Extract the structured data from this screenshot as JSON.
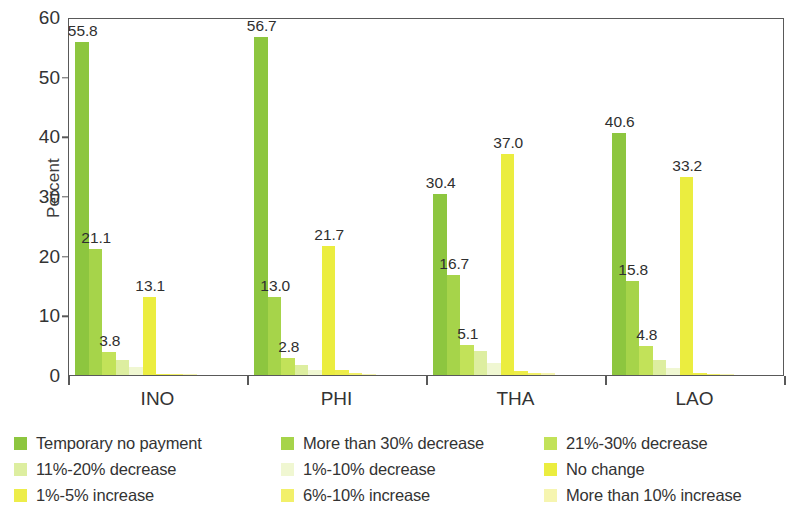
{
  "chart_data": {
    "type": "bar",
    "title": "",
    "subtitle": "",
    "xlabel": "",
    "ylabel": "Percent",
    "ylim": [
      0,
      60
    ],
    "yticks": [
      0,
      10,
      20,
      30,
      40,
      50,
      60
    ],
    "ytick_labels": [
      "0",
      "10",
      "20",
      "30",
      "40",
      "50",
      "60"
    ],
    "grid": false,
    "legend_position": "bottom",
    "grouping": "grouped",
    "categories": [
      "INO",
      "PHI",
      "THA",
      "LAO"
    ],
    "series": [
      {
        "name": "Temporary no payment",
        "color": "#8dc63f",
        "values": [
          55.8,
          56.7,
          30.4,
          40.6
        ],
        "labels": [
          "55.8",
          "56.7",
          "30.4",
          "40.6"
        ]
      },
      {
        "name": "More than 30% decrease",
        "color": "#a6d44a",
        "values": [
          21.1,
          13.0,
          16.7,
          15.8
        ],
        "labels": [
          "21.1",
          "13.0",
          "16.7",
          "15.8"
        ]
      },
      {
        "name": "21%-30% decrease",
        "color": "#c2e259",
        "values": [
          3.8,
          2.8,
          5.1,
          4.8
        ],
        "labels": [
          "3.8",
          "2.8",
          "5.1",
          "4.8"
        ]
      },
      {
        "name": "11%-20% decrease",
        "color": "#ddeea0",
        "values": [
          2.6,
          1.6,
          4.0,
          2.5
        ],
        "labels": [
          "",
          "",
          "",
          ""
        ]
      },
      {
        "name": "1%-10% decrease",
        "color": "#f0f7d2",
        "values": [
          1.4,
          0.9,
          2.0,
          1.2
        ],
        "labels": [
          "",
          "",
          "",
          ""
        ]
      },
      {
        "name": "No change",
        "color": "#ebed3f",
        "values": [
          13.1,
          21.7,
          37.0,
          33.2
        ],
        "labels": [
          "13.1",
          "21.7",
          "37.0",
          "33.2"
        ]
      },
      {
        "name": "1%-5% increase",
        "color": "#eded4a",
        "values": [
          0.2,
          0.8,
          0.7,
          0.4
        ],
        "labels": [
          "",
          "",
          "",
          ""
        ]
      },
      {
        "name": "6%-10% increase",
        "color": "#f2f06a",
        "values": [
          0.1,
          0.3,
          0.4,
          0.2
        ],
        "labels": [
          "",
          "",
          "",
          ""
        ]
      },
      {
        "name": "More than 10% increase",
        "color": "#f6f5b0",
        "values": [
          0.1,
          0.2,
          0.3,
          0.1
        ],
        "labels": [
          "",
          "",
          "",
          ""
        ]
      }
    ]
  },
  "legend": {
    "rows": [
      [
        {
          "label": "Temporary no payment",
          "color": "#8dc63f"
        },
        {
          "label": "More than 30% decrease",
          "color": "#a6d44a"
        },
        {
          "label": "21%-30% decrease",
          "color": "#c2e259"
        }
      ],
      [
        {
          "label": "11%-20% decrease",
          "color": "#ddeea0"
        },
        {
          "label": "1%-10% decrease",
          "color": "#f0f7d2"
        },
        {
          "label": "No change",
          "color": "#ebed3f"
        }
      ],
      [
        {
          "label": "1%-5% increase",
          "color": "#eded4a"
        },
        {
          "label": "6%-10% increase",
          "color": "#f2f06a"
        },
        {
          "label": "More than 10% increase",
          "color": "#f6f5b0"
        }
      ]
    ]
  }
}
